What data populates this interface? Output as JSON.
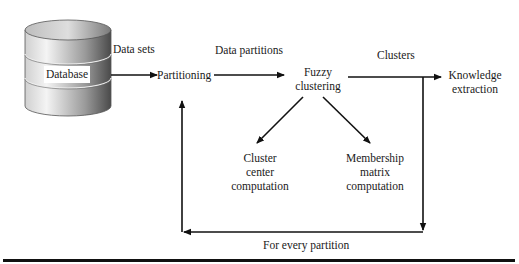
{
  "diagram": {
    "nodes": {
      "database": "Database",
      "partitioning": "Partitioning",
      "fuzzy_clustering": [
        "Fuzzy",
        "clustering"
      ],
      "knowledge_extraction": [
        "Knowledge",
        "extraction"
      ],
      "cluster_center": [
        "Cluster",
        "center",
        "computation"
      ],
      "membership_matrix": [
        "Membership",
        "matrix",
        "computation"
      ]
    },
    "edges": {
      "data_sets": "Data sets",
      "data_partitions": "Data partitions",
      "clusters": "Clusters",
      "for_every_partition": "For every partition"
    },
    "colors": {
      "line": "#111111",
      "cylinder_light": "#f2f2f2",
      "cylinder_dark": "#555555"
    }
  }
}
